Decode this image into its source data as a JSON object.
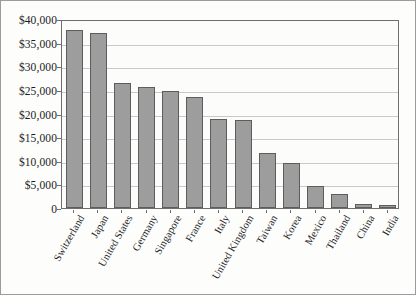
{
  "chart_data": {
    "type": "bar",
    "title": "",
    "xlabel": "",
    "ylabel": "",
    "ylim": [
      0,
      40000
    ],
    "grid": true,
    "legend": "none",
    "categories": [
      "Switzerland",
      "Japan",
      "United States",
      "Germany",
      "Singapore",
      "France",
      "Italy",
      "United Kingdom",
      "Taiwan",
      "Korea",
      "Mexico",
      "Thailand",
      "China",
      "India"
    ],
    "values": [
      37700,
      37000,
      26400,
      25700,
      24800,
      23400,
      18900,
      18700,
      11700,
      9600,
      4700,
      3000,
      900,
      700
    ],
    "y_ticks": [
      0,
      5000,
      10000,
      15000,
      20000,
      25000,
      30000,
      35000,
      40000
    ],
    "y_tick_labels": [
      "0",
      "$5,000",
      "$10,000",
      "$15,000",
      "$20,000",
      "$25,000",
      "$30,000",
      "$35,000",
      "$40,000"
    ]
  },
  "style": {
    "bar_fill": "#9d9d9d",
    "bar_border": "#5d5d5d",
    "gridline_color": "#c9c9c9",
    "plot_border": "#6e6e6e",
    "frame_border": "#9b9b9b",
    "background": "#fdfdfc",
    "text_color": "#1c1c1c"
  }
}
